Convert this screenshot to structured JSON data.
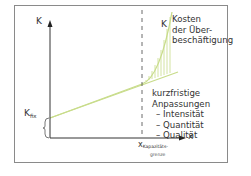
{
  "diagram": {
    "y_axis_label": "K",
    "x_axis_label": "x",
    "curve_label": "K",
    "overemployment_label": [
      "Kosten",
      "der Über-",
      "beschäftigung"
    ],
    "adjustments": {
      "title": [
        "kurzfristige",
        "Anpassungen"
      ],
      "items": [
        "– Intensität",
        "– Quantität",
        "– Qualität"
      ]
    },
    "fixed_cost_label": "K",
    "fixed_cost_sub": "fix",
    "capacity_label": "x",
    "capacity_sub": "Kapazitäts-",
    "capacity_sub2": "grenze",
    "colors": {
      "curve": "#c8dc8a",
      "hatch": "#c8dc8a",
      "axis": "#333333",
      "frame": "#8a8a8a"
    }
  }
}
